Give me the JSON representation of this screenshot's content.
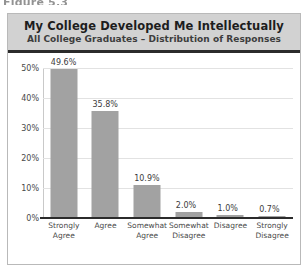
{
  "figure_caption": "Figure 5.3",
  "header": {
    "title": "My College Developed Me Intellectually",
    "subtitle": "All College Graduates – Distribution of Responses"
  },
  "axis": {
    "y_ticks": [
      "50%",
      "40%",
      "30%",
      "20%",
      "10%",
      "0%"
    ]
  },
  "colors": {
    "bar": "#a2a2a2",
    "header_band": "#d2d2d2",
    "axis_line": "#2b2b2b",
    "gridline": "#e2e2e2",
    "card_border": "#b9b9b9"
  },
  "chart_data": {
    "type": "bar",
    "title": "My College Developed Me Intellectually",
    "subtitle": "All College Graduates – Distribution of Responses",
    "xlabel": "",
    "ylabel": "",
    "ylim": [
      0,
      50
    ],
    "ytick_values": [
      0,
      10,
      20,
      30,
      40,
      50
    ],
    "ytick_labels": [
      "0%",
      "10%",
      "20%",
      "30%",
      "40%",
      "50%"
    ],
    "grid": true,
    "legend": false,
    "categories": [
      "Strongly\nAgree",
      "Agree",
      "Somewhat\nAgree",
      "Somewhat\nDisagree",
      "Disagree",
      "Strongly\nDisagree"
    ],
    "values": [
      49.6,
      35.8,
      10.9,
      2.0,
      1.0,
      0.7
    ],
    "data_labels": [
      "49.6%",
      "35.8%",
      "10.9%",
      "2.0%",
      "1.0%",
      "0.7%"
    ]
  }
}
